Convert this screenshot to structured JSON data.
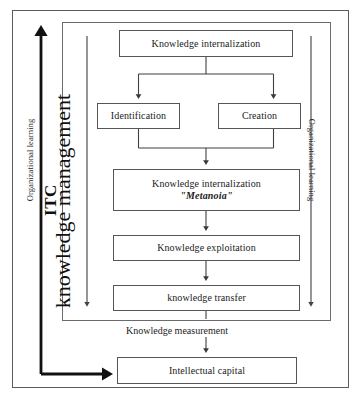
{
  "diagram": {
    "type": "flowchart",
    "boxes": [
      {
        "id": "internalization",
        "label": "Knowledge internalization"
      },
      {
        "id": "identification",
        "label": "Identification"
      },
      {
        "id": "creation",
        "label": "Creation"
      },
      {
        "id": "metanoia",
        "label_line1": "Knowledge internalization",
        "label_line2": "\"Metanoia\""
      },
      {
        "id": "exploitation",
        "label": "Knowledge exploitation"
      },
      {
        "id": "transfer",
        "label": "knowledge transfer"
      },
      {
        "id": "intellectual",
        "label": "Intellectual capital"
      }
    ],
    "labels": {
      "knowledge_measurement": "Knowledge measurement",
      "organizational_learning_left": "Organizational learning",
      "organizational_learning_right": "Organizational learning",
      "knowledge_management": "knowledge management",
      "itc": "ITC"
    },
    "colors": {
      "stroke": "#555555",
      "frame": "#5b5b5b",
      "text": "#1b1b1b",
      "thick_arrow": "#111111",
      "background": "#ffffff"
    },
    "flows": [
      {
        "from": "internalization",
        "to": "identification"
      },
      {
        "from": "internalization",
        "to": "creation"
      },
      {
        "from": "identification",
        "to": "metanoia"
      },
      {
        "from": "creation",
        "to": "metanoia"
      },
      {
        "from": "metanoia",
        "to": "exploitation"
      },
      {
        "from": "exploitation",
        "to": "transfer"
      },
      {
        "from": "transfer",
        "to": "intellectual"
      },
      {
        "from": "intellectual",
        "to": "knowledge_management"
      }
    ]
  }
}
